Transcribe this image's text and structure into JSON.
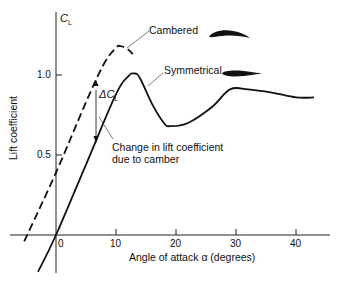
{
  "chart_data": {
    "type": "line",
    "title": "",
    "xlabel": "Angle of attack α (degrees)",
    "ylabel": "Lift coefficient",
    "y_axis_symbol": "C_L",
    "xlim": [
      -8,
      46
    ],
    "ylim": [
      -0.25,
      1.4
    ],
    "x_ticks": [
      0,
      10,
      20,
      30,
      40
    ],
    "x_tick_labels": [
      "0",
      "10",
      "20",
      "30",
      "40"
    ],
    "y_ticks": [
      0.5,
      1.0
    ],
    "y_tick_labels": [
      "0.5",
      "1.0"
    ],
    "grid": false,
    "legend": "inline labels",
    "series": [
      {
        "name": "Cambered",
        "style": "dashed",
        "x": [
          -5.3,
          0,
          5,
          8,
          10,
          10.8,
          12,
          12.8
        ],
        "y": [
          -0.04,
          0.39,
          0.83,
          1.07,
          1.17,
          1.18,
          1.16,
          1.13
        ]
      },
      {
        "name": "Symmetrical",
        "style": "solid",
        "x": [
          -3,
          0,
          5,
          10,
          12,
          13,
          14,
          16,
          18,
          19,
          22,
          26,
          29,
          32,
          36,
          40,
          43
        ],
        "y": [
          -0.23,
          0,
          0.44,
          0.88,
          0.99,
          1.01,
          0.98,
          0.82,
          0.7,
          0.68,
          0.7,
          0.8,
          0.91,
          0.91,
          0.89,
          0.86,
          0.86
        ]
      }
    ],
    "annotations": [
      {
        "text": "Cambered",
        "points_to": "cambered curve peak"
      },
      {
        "text": "Symmetrical",
        "points_to": "symmetrical curve peak"
      },
      {
        "text": "ΔC_L",
        "type": "vertical arrow at α≈6.7 from cambered to symmetrical line"
      },
      {
        "text": "Change in lift coefficient due to camber",
        "points_to": "ΔC_L arrow"
      }
    ],
    "icons": [
      "cambered-airfoil-icon",
      "symmetrical-airfoil-icon"
    ]
  },
  "labels": {
    "cl_symbol": "C",
    "cl_sub": "L",
    "delta_symbol": "ΔC",
    "delta_sub": "L",
    "cambered": "Cambered",
    "symmetrical": "Symmetrical",
    "change_line1": "Change in lift coefficient",
    "change_line2": "due to camber",
    "xlabel": "Angle of attack α (degrees)",
    "ylabel": "Lift coefficient",
    "y_tick_1": "1.0",
    "y_tick_05": "0.5",
    "x_tick_0": "0",
    "x_tick_10": "10",
    "x_tick_20": "20",
    "x_tick_30": "30",
    "x_tick_40": "40"
  }
}
